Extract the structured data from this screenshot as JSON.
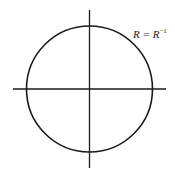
{
  "diagram": {
    "type": "unit-circle-axes",
    "label": {
      "base": "R = R",
      "superscript": "−1"
    },
    "colors": {
      "stroke": "#1a1a1a",
      "background": "#ffffff"
    },
    "circle": {
      "cx": 89.5,
      "cy": 89,
      "r": 63
    },
    "horizontal_axis": {
      "x1": 13,
      "x2": 166,
      "y": 89
    },
    "vertical_axis": {
      "x": 89.5,
      "y1": 10,
      "y2": 168
    }
  }
}
